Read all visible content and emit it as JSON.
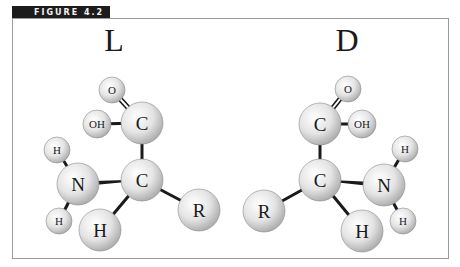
{
  "figure": {
    "label": "FIGURE 4.2",
    "label_bg": "#1c1c1c",
    "frame_color": "#9a9a9a"
  },
  "molecules": [
    {
      "name": "L",
      "title": "L",
      "title_pos": [
        114,
        51
      ],
      "atoms": [
        {
          "id": "O",
          "label": "O",
          "x": 112,
          "y": 90,
          "r": 13,
          "size": 11
        },
        {
          "id": "OH",
          "label": "OH",
          "x": 97,
          "y": 124,
          "r": 14,
          "size": 11
        },
        {
          "id": "C1",
          "label": "C",
          "x": 142,
          "y": 123,
          "r": 21,
          "size": 19
        },
        {
          "id": "C2",
          "label": "C",
          "x": 142,
          "y": 180,
          "r": 21,
          "size": 19
        },
        {
          "id": "N",
          "label": "N",
          "x": 78,
          "y": 184,
          "r": 21,
          "size": 19
        },
        {
          "id": "Ht",
          "label": "H",
          "x": 57,
          "y": 150,
          "r": 13,
          "size": 11
        },
        {
          "id": "Hb",
          "label": "H",
          "x": 59,
          "y": 221,
          "r": 13,
          "size": 11
        },
        {
          "id": "H",
          "label": "H",
          "x": 100,
          "y": 230,
          "r": 21,
          "size": 19
        },
        {
          "id": "R",
          "label": "R",
          "x": 199,
          "y": 210,
          "r": 21,
          "size": 19
        }
      ],
      "bonds": [
        {
          "from": "O",
          "to": "C1",
          "double": true
        },
        {
          "from": "OH",
          "to": "C1"
        },
        {
          "from": "C1",
          "to": "C2"
        },
        {
          "from": "C2",
          "to": "N",
          "wedge": true
        },
        {
          "from": "Ht",
          "to": "N"
        },
        {
          "from": "Hb",
          "to": "N"
        },
        {
          "from": "C2",
          "to": "H"
        },
        {
          "from": "C2",
          "to": "R"
        }
      ]
    },
    {
      "name": "D",
      "title": "D",
      "title_pos": [
        347,
        51
      ],
      "atoms": [
        {
          "id": "O",
          "label": "O",
          "x": 348,
          "y": 89,
          "r": 13,
          "size": 11
        },
        {
          "id": "OH",
          "label": "OH",
          "x": 362,
          "y": 124,
          "r": 14,
          "size": 11
        },
        {
          "id": "C1",
          "label": "C",
          "x": 320,
          "y": 124,
          "r": 21,
          "size": 19
        },
        {
          "id": "C2",
          "label": "C",
          "x": 320,
          "y": 180,
          "r": 21,
          "size": 19
        },
        {
          "id": "N",
          "label": "N",
          "x": 384,
          "y": 185,
          "r": 21,
          "size": 19
        },
        {
          "id": "Ht",
          "label": "H",
          "x": 405,
          "y": 149,
          "r": 13,
          "size": 11
        },
        {
          "id": "Hb",
          "label": "H",
          "x": 403,
          "y": 221,
          "r": 13,
          "size": 11
        },
        {
          "id": "H",
          "label": "H",
          "x": 362,
          "y": 231,
          "r": 21,
          "size": 19
        },
        {
          "id": "R",
          "label": "R",
          "x": 264,
          "y": 211,
          "r": 21,
          "size": 19
        }
      ],
      "bonds": [
        {
          "from": "O",
          "to": "C1",
          "double": true
        },
        {
          "from": "OH",
          "to": "C1"
        },
        {
          "from": "C1",
          "to": "C2"
        },
        {
          "from": "C2",
          "to": "N",
          "wedge": true
        },
        {
          "from": "Ht",
          "to": "N"
        },
        {
          "from": "Hb",
          "to": "N"
        },
        {
          "from": "C2",
          "to": "H"
        },
        {
          "from": "C2",
          "to": "R"
        }
      ]
    }
  ]
}
